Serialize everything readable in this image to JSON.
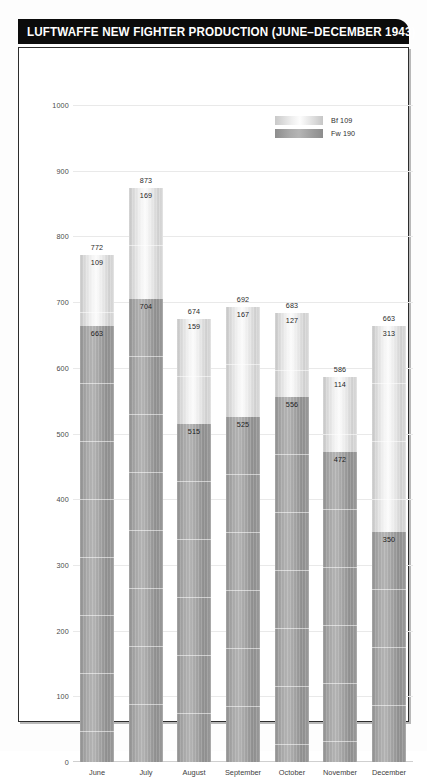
{
  "title": "LUFTWAFFE NEW FIGHTER PRODUCTION (JUNE–DECEMBER 1943)",
  "legend": {
    "items": [
      {
        "label": "Bf 109",
        "swatch": "light-gradient-swatch"
      },
      {
        "label": "Fw 190",
        "swatch": "dark-gradient-swatch"
      }
    ]
  },
  "chart_data": {
    "type": "bar",
    "stacked": true,
    "title": "LUFTWAFFE NEW FIGHTER PRODUCTION (JUNE–DECEMBER 1943)",
    "xlabel": "",
    "ylabel": "",
    "ylim": [
      0,
      1000
    ],
    "ytick_step": 100,
    "yticks": [
      "1000",
      "900",
      "800",
      "700",
      "600",
      "500",
      "400",
      "300",
      "200",
      "100",
      "0"
    ],
    "grid": true,
    "legend_position": "top-right-inside",
    "categories": [
      "June",
      "July",
      "August",
      "September",
      "October",
      "November",
      "December"
    ],
    "series": [
      {
        "name": "Fw 190",
        "values": [
          663,
          704,
          515,
          525,
          556,
          472,
          350
        ]
      },
      {
        "name": "Bf 109",
        "values": [
          109,
          169,
          159,
          167,
          127,
          114,
          313
        ]
      }
    ],
    "totals": [
      772,
      873,
      674,
      692,
      683,
      586,
      663
    ],
    "bar_labels": {
      "June": {
        "total": "772",
        "bf": "109",
        "fw": "663"
      },
      "July": {
        "total": "873",
        "bf": "169",
        "fw": "704"
      },
      "August": {
        "total": "674",
        "bf": "159",
        "fw": "515"
      },
      "September": {
        "total": "692",
        "bf": "167",
        "fw": "525"
      },
      "October": {
        "total": "683",
        "bf": "127",
        "fw": "556"
      },
      "November": {
        "total": "586",
        "bf": "114",
        "fw": "472"
      },
      "December": {
        "total": "663",
        "bf": "313",
        "fw": "350"
      }
    },
    "colors": {
      "title_bar_background": "#0b0b0b",
      "title_text": "#ffffff",
      "bf109_fill": "#e7e7e7",
      "fw190_fill": "#a3a3a3",
      "gridline": "#e9e9e9",
      "frame_border": "#2d2d2d"
    }
  }
}
